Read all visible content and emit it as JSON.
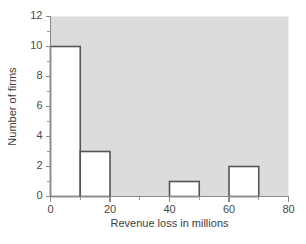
{
  "chart_data": {
    "type": "bar",
    "title": "",
    "subtitle": "",
    "xlabel": "Revenue loss in millions",
    "ylabel": "Number of firms",
    "xlim": [
      0,
      80
    ],
    "ylim": [
      0,
      12
    ],
    "grid": false,
    "legend": null,
    "bin_width": 10,
    "bin_edges": [
      0,
      10,
      20,
      30,
      40,
      50,
      60,
      70,
      80
    ],
    "categories": [
      "0-10",
      "10-20",
      "20-30",
      "30-40",
      "40-50",
      "50-60",
      "60-70",
      "70-80"
    ],
    "values": [
      10,
      3,
      0,
      0,
      1,
      0,
      2,
      0
    ],
    "bars": [
      {
        "x0": 0,
        "x1": 10,
        "height": 10
      },
      {
        "x0": 10,
        "x1": 20,
        "height": 3
      },
      {
        "x0": 20,
        "x1": 30,
        "height": 0
      },
      {
        "x0": 30,
        "x1": 40,
        "height": 0
      },
      {
        "x0": 40,
        "x1": 50,
        "height": 1
      },
      {
        "x0": 50,
        "x1": 60,
        "height": 0
      },
      {
        "x0": 60,
        "x1": 70,
        "height": 2
      },
      {
        "x0": 70,
        "x1": 80,
        "height": 0
      }
    ],
    "xticks": [
      0,
      20,
      40,
      60,
      80
    ],
    "xtick_labels": [
      "0",
      "20",
      "40",
      "60",
      "80"
    ],
    "xticks_minor": [
      10,
      30,
      50,
      70
    ],
    "yticks": [
      0,
      2,
      4,
      6,
      8,
      10,
      12
    ],
    "ytick_labels": [
      "0",
      "2",
      "4",
      "6",
      "8",
      "10",
      "12"
    ],
    "yticks_minor": [
      1,
      3,
      5,
      7,
      9,
      11
    ],
    "colors": {
      "plot_background": "#dcdcdc",
      "figure_background": "#ffffff",
      "bar_fill": "#ffffff",
      "bar_edge": "#555555",
      "axis": "#888888",
      "text": "#3d3d3d"
    }
  }
}
